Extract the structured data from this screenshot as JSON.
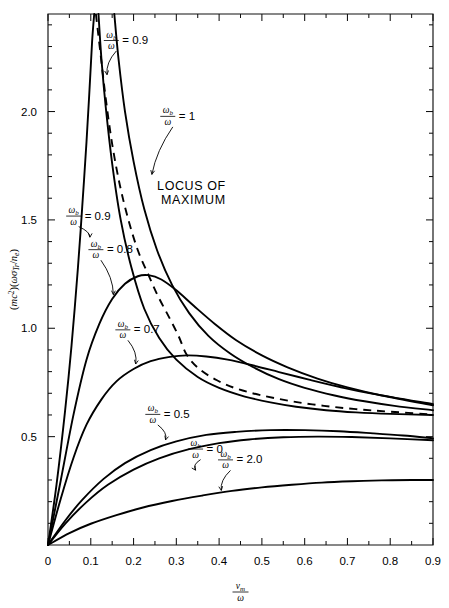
{
  "figure": {
    "background_color": "#ffffff",
    "line_color": "#000000"
  },
  "chart_data": {
    "type": "line",
    "title": "",
    "subtitle": "",
    "xlabel_numerator": "ν",
    "xlabel_numerator_sub": "m",
    "xlabel_denominator": "ω",
    "xlabel_plain": "ν_m/ω",
    "ylabel_plain": "(mc²)(ωσ_Tr/n_e)",
    "ylabel_parts": {
      "open1": "(",
      "m": "m",
      "c": "c",
      "sup2": "2",
      "close1": ")(",
      "omega": "ω",
      "sigma": "σ",
      "sigma_sub": "Tr",
      "slash": "/",
      "n": "n",
      "n_sub": "e",
      "close2": ")"
    },
    "xlim": [
      0,
      0.9
    ],
    "ylim": [
      0,
      2.45
    ],
    "x_ticks_major": [
      "0",
      "0.1",
      "0.2",
      "0.3",
      "0.4",
      "0.5",
      "0.6",
      "0.7",
      "0.8",
      "0.9"
    ],
    "x_ticks_major_values": [
      0,
      0.1,
      0.2,
      0.3,
      0.4,
      0.5,
      0.6,
      0.7,
      0.8,
      0.9
    ],
    "x_minor_step": 0.05,
    "y_ticks_major": [
      "0.5",
      "1.0",
      "1.5",
      "2.0"
    ],
    "y_ticks_major_values": [
      0.5,
      1.0,
      1.5,
      2.0
    ],
    "y_minor_step": 0.1,
    "grid": false,
    "legend_position": "inline-annotations",
    "annotations": [
      {
        "id": "locus-of-maximum",
        "text_line1": "LOCUS OF",
        "text_line2": "MAXIMUM",
        "x": 0.255,
        "y": 1.64
      }
    ],
    "curve_label_prefix_num": "ω",
    "curve_label_prefix_num_sub": "b",
    "curve_label_prefix_den": "ω",
    "curve_label_equals": "=",
    "series": [
      {
        "name": "omega_b/omega = 0.9 (steep, rising branch)",
        "label_value": "0.9",
        "label_x": 0.06,
        "label_y": 1.52,
        "arrow_to_x": 0.098,
        "arrow_to_y": 1.42,
        "points": [
          [
            0.0,
            0.0
          ],
          [
            0.02,
            0.28
          ],
          [
            0.04,
            0.62
          ],
          [
            0.055,
            0.92
          ],
          [
            0.07,
            1.28
          ],
          [
            0.08,
            1.56
          ],
          [
            0.09,
            1.86
          ],
          [
            0.097,
            2.1
          ],
          [
            0.103,
            2.32
          ],
          [
            0.108,
            2.45
          ]
        ]
      },
      {
        "name": "omega_b/omega = 0.9 (upper, falling branch)",
        "label_value": "0.9",
        "label_x": 0.148,
        "label_y": 2.33,
        "arrow_to_x": 0.138,
        "arrow_to_y": 2.17,
        "points": [
          [
            0.118,
            2.45
          ],
          [
            0.125,
            2.24
          ],
          [
            0.135,
            2.02
          ],
          [
            0.15,
            1.76
          ],
          [
            0.17,
            1.5
          ],
          [
            0.195,
            1.28
          ],
          [
            0.225,
            1.09
          ],
          [
            0.26,
            0.955
          ],
          [
            0.3,
            0.855
          ],
          [
            0.35,
            0.775
          ],
          [
            0.4,
            0.725
          ],
          [
            0.46,
            0.685
          ],
          [
            0.52,
            0.658
          ],
          [
            0.58,
            0.638
          ],
          [
            0.65,
            0.622
          ],
          [
            0.72,
            0.612
          ],
          [
            0.8,
            0.605
          ],
          [
            0.9,
            0.6
          ]
        ]
      },
      {
        "name": "omega_b/omega = 1",
        "label_value": "1",
        "label_x": 0.28,
        "label_y": 1.98,
        "arrow_to_x": 0.243,
        "arrow_to_y": 1.71,
        "points": [
          [
            0.155,
            2.45
          ],
          [
            0.165,
            2.24
          ],
          [
            0.18,
            2.0
          ],
          [
            0.2,
            1.77
          ],
          [
            0.225,
            1.55
          ],
          [
            0.255,
            1.36
          ],
          [
            0.29,
            1.2
          ],
          [
            0.33,
            1.07
          ],
          [
            0.375,
            0.965
          ],
          [
            0.425,
            0.885
          ],
          [
            0.48,
            0.82
          ],
          [
            0.54,
            0.765
          ],
          [
            0.6,
            0.725
          ],
          [
            0.67,
            0.69
          ],
          [
            0.74,
            0.663
          ],
          [
            0.81,
            0.642
          ],
          [
            0.9,
            0.622
          ]
        ]
      },
      {
        "name": "omega_b/omega = 0.8",
        "label_value": "0.8",
        "label_x": 0.112,
        "label_y": 1.365,
        "arrow_to_x": 0.153,
        "arrow_to_y": 1.155,
        "peak": [
          0.235,
          1.245
        ],
        "points": [
          [
            0.0,
            0.0
          ],
          [
            0.03,
            0.3
          ],
          [
            0.06,
            0.605
          ],
          [
            0.09,
            0.855
          ],
          [
            0.12,
            1.02
          ],
          [
            0.15,
            1.135
          ],
          [
            0.18,
            1.205
          ],
          [
            0.21,
            1.24
          ],
          [
            0.235,
            1.245
          ],
          [
            0.265,
            1.225
          ],
          [
            0.3,
            1.175
          ],
          [
            0.34,
            1.105
          ],
          [
            0.39,
            1.02
          ],
          [
            0.44,
            0.945
          ],
          [
            0.5,
            0.875
          ],
          [
            0.56,
            0.82
          ],
          [
            0.63,
            0.768
          ],
          [
            0.7,
            0.727
          ],
          [
            0.78,
            0.69
          ],
          [
            0.9,
            0.645
          ]
        ]
      },
      {
        "name": "omega_b/omega = 0.7",
        "label_value": "0.7",
        "label_x": 0.175,
        "label_y": 0.995,
        "arrow_to_x": 0.205,
        "arrow_to_y": 0.835,
        "peak": [
          0.325,
          0.875
        ],
        "points": [
          [
            0.0,
            0.0
          ],
          [
            0.03,
            0.215
          ],
          [
            0.06,
            0.405
          ],
          [
            0.09,
            0.555
          ],
          [
            0.125,
            0.672
          ],
          [
            0.16,
            0.755
          ],
          [
            0.2,
            0.812
          ],
          [
            0.24,
            0.848
          ],
          [
            0.285,
            0.868
          ],
          [
            0.325,
            0.875
          ],
          [
            0.37,
            0.87
          ],
          [
            0.42,
            0.855
          ],
          [
            0.48,
            0.828
          ],
          [
            0.54,
            0.798
          ],
          [
            0.61,
            0.763
          ],
          [
            0.68,
            0.73
          ],
          [
            0.76,
            0.697
          ],
          [
            0.9,
            0.65
          ]
        ]
      },
      {
        "name": "omega_b/omega = 0.5",
        "label_value": "0.5",
        "label_x": 0.245,
        "label_y": 0.605,
        "arrow_to_x": 0.275,
        "arrow_to_y": 0.485,
        "peak": [
          0.6,
          0.53
        ],
        "points": [
          [
            0.0,
            0.0
          ],
          [
            0.04,
            0.112
          ],
          [
            0.08,
            0.208
          ],
          [
            0.13,
            0.305
          ],
          [
            0.18,
            0.378
          ],
          [
            0.24,
            0.438
          ],
          [
            0.3,
            0.478
          ],
          [
            0.37,
            0.508
          ],
          [
            0.44,
            0.522
          ],
          [
            0.52,
            0.53
          ],
          [
            0.6,
            0.53
          ],
          [
            0.68,
            0.525
          ],
          [
            0.76,
            0.515
          ],
          [
            0.83,
            0.505
          ],
          [
            0.9,
            0.492
          ]
        ]
      },
      {
        "name": "omega_b/omega = 0",
        "label_value": "0",
        "label_x": 0.345,
        "label_y": 0.445,
        "arrow_to_x": 0.345,
        "arrow_to_y": 0.345,
        "points": [
          [
            0.0,
            0.0
          ],
          [
            0.04,
            0.098
          ],
          [
            0.09,
            0.198
          ],
          [
            0.14,
            0.278
          ],
          [
            0.2,
            0.348
          ],
          [
            0.26,
            0.4
          ],
          [
            0.33,
            0.442
          ],
          [
            0.4,
            0.47
          ],
          [
            0.47,
            0.487
          ],
          [
            0.55,
            0.497
          ],
          [
            0.63,
            0.5
          ],
          [
            0.71,
            0.498
          ],
          [
            0.8,
            0.492
          ],
          [
            0.9,
            0.483
          ]
        ]
      },
      {
        "name": "omega_b/omega = 2.0",
        "label_value": "2.0",
        "label_x": 0.415,
        "label_y": 0.395,
        "arrow_to_x": 0.405,
        "arrow_to_y": 0.252,
        "points": [
          [
            0.0,
            0.0
          ],
          [
            0.05,
            0.055
          ],
          [
            0.1,
            0.098
          ],
          [
            0.16,
            0.138
          ],
          [
            0.22,
            0.172
          ],
          [
            0.29,
            0.203
          ],
          [
            0.36,
            0.228
          ],
          [
            0.43,
            0.25
          ],
          [
            0.5,
            0.266
          ],
          [
            0.57,
            0.278
          ],
          [
            0.64,
            0.288
          ],
          [
            0.71,
            0.294
          ],
          [
            0.78,
            0.298
          ],
          [
            0.85,
            0.3
          ],
          [
            0.9,
            0.3
          ]
        ]
      }
    ],
    "locus_curve": {
      "name": "locus of maximum",
      "dashed": true,
      "points": [
        [
          0.112,
          2.45
        ],
        [
          0.122,
          2.28
        ],
        [
          0.135,
          2.06
        ],
        [
          0.15,
          1.85
        ],
        [
          0.168,
          1.66
        ],
        [
          0.188,
          1.5
        ],
        [
          0.21,
          1.36
        ],
        [
          0.235,
          1.245
        ],
        [
          0.258,
          1.145
        ],
        [
          0.282,
          1.055
        ],
        [
          0.305,
          0.965
        ],
        [
          0.325,
          0.875
        ],
        [
          0.355,
          0.81
        ],
        [
          0.395,
          0.76
        ],
        [
          0.44,
          0.722
        ],
        [
          0.5,
          0.69
        ],
        [
          0.57,
          0.663
        ],
        [
          0.645,
          0.642
        ],
        [
          0.72,
          0.627
        ],
        [
          0.8,
          0.615
        ],
        [
          0.9,
          0.602
        ]
      ]
    }
  }
}
